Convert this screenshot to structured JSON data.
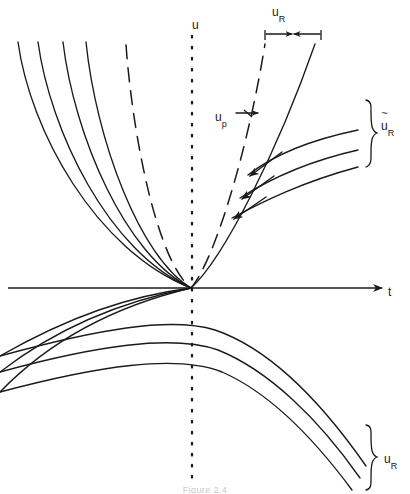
{
  "figure": {
    "caption": "Figure 2.4",
    "axes": {
      "vertical_axis_label": "u",
      "vertical_axis_style": "dotted",
      "horizontal_axis_label": "t",
      "horizontal_axis_style": "solid-with-arrowhead",
      "origin": {
        "x": 192,
        "y": 288
      }
    },
    "labels": {
      "u": "u",
      "t": "t",
      "u_p": {
        "base": "u",
        "subscript": "p",
        "accent": "none"
      },
      "u_hat_R": {
        "base": "u",
        "subscript": "R",
        "accent": "hat"
      },
      "u_tilde_R": {
        "base": "u",
        "subscript": "R",
        "accent": "tilde"
      },
      "u_R": {
        "base": "u",
        "subscript": "R",
        "accent": "none"
      }
    },
    "annotations": {
      "top_measure": {
        "name": "u-hat-R-span",
        "type": "horizontal-double-arrow",
        "label": "u_hat_R",
        "x_start": 265,
        "x_end": 321,
        "y": 34
      },
      "right_middle_measure": {
        "name": "u-tilde-R-span",
        "type": "vertical-brace",
        "label": "u_tilde_R",
        "y_start": 100,
        "y_end": 168,
        "x": 372
      },
      "bottom_right_measure": {
        "name": "u-R-span",
        "type": "vertical-brace",
        "label": "u_R",
        "y_start": 425,
        "y_end": 490,
        "x": 372
      },
      "u_p_arrow": {
        "name": "u-p-arrow",
        "type": "horizontal-double-arrow",
        "x_start": 236,
        "x_end": 262,
        "y": 113
      },
      "perturbation_arrows": {
        "name": "perturbation-arrows",
        "count": 3,
        "direction": "down-left",
        "description": "three arrows pointing from the right solid branches back toward the dashed reference branch"
      }
    },
    "curves": {
      "colors": {
        "ink": "#1a1a1a"
      },
      "left_upper_solid": [
        {
          "name": "left-branch-1",
          "d": "M 18 42 C 30 130 95 250 191 288"
        },
        {
          "name": "left-branch-2",
          "d": "M 38 42 C 50 130 108 252 191 288"
        },
        {
          "name": "left-branch-3",
          "d": "M 63 42 C 74 135 125 255 191 288"
        },
        {
          "name": "left-branch-4",
          "d": "M 86 42 C 96 140 140 258 191 288"
        }
      ],
      "left_upper_dashed": {
        "name": "left-branch-dashed",
        "d": "M 126 45 C 133 140 158 262 191 288",
        "dash": "14 9"
      },
      "right_upper_solid": {
        "name": "right-branch-outer",
        "d": "M 191 288 C 224 258 278 150 315 44"
      },
      "right_upper_dashed": {
        "name": "right-branch-dashed",
        "d": "M 191 288 C 214 262 248 150 265 44",
        "dash": "14 9"
      },
      "right_fan_solid": [
        {
          "name": "right-fan-1",
          "d": "M 248 175 C 272 156 310 140 358 130"
        },
        {
          "name": "right-fan-2",
          "d": "M 240 198 C 268 180 305 162 358 150"
        },
        {
          "name": "right-fan-3",
          "d": "M 232 218 C 262 202 302 182 358 167"
        }
      ],
      "lower_left_solid": [
        {
          "name": "lower-branch-1",
          "d": "M 191 288 C 130 296 70 316 0 356"
        },
        {
          "name": "lower-branch-2",
          "d": "M 191 288 C 128 300 62 324 0 372"
        },
        {
          "name": "lower-branch-3",
          "d": "M 191 288 C 124 304 56 334 0 392"
        }
      ],
      "lower_right_solid": [
        {
          "name": "lower-right-branch-1",
          "d": "M 0 356 C 95 330 170 316 215 330 C 268 348 320 400 366 466"
        },
        {
          "name": "lower-right-branch-2",
          "d": "M 0 372 C 95 346 172 334 218 350 C 268 370 318 418 360 478"
        },
        {
          "name": "lower-right-branch-3",
          "d": "M 0 392 C 98 366 176 354 222 372 C 268 392 312 436 352 490"
        }
      ]
    }
  }
}
